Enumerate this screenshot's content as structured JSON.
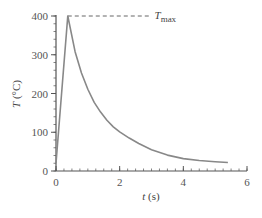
{
  "chart_data": {
    "type": "line",
    "title": "",
    "xlabel": "t (s)",
    "xlabel_var": "t",
    "xlabel_unit": " (s)",
    "ylabel": "T (°C)",
    "ylabel_var": "T",
    "ylabel_unit": " (°C)",
    "xlim": [
      0,
      6
    ],
    "ylim": [
      0,
      400
    ],
    "xticks": [
      0,
      2,
      4,
      6
    ],
    "yticks": [
      0,
      100,
      200,
      300,
      400
    ],
    "x_minor_step": 0.25,
    "y_minor_step": 20,
    "grid": false,
    "legend": null,
    "series": [
      {
        "name": "Temperature",
        "color": "#888888",
        "x": [
          0.0,
          0.37,
          0.6,
          0.8,
          1.0,
          1.2,
          1.4,
          1.6,
          1.8,
          2.0,
          2.3,
          2.6,
          3.0,
          3.5,
          4.0,
          4.5,
          5.0,
          5.4
        ],
        "y": [
          20,
          400,
          308,
          253,
          211,
          177,
          152,
          131,
          114,
          101,
          85,
          71,
          55,
          41,
          32,
          27,
          24,
          22
        ]
      }
    ],
    "annotations": [
      {
        "type": "hline",
        "y": 400,
        "x_start": 0.37,
        "x_end": 3.0,
        "style": "dashed",
        "label": "T",
        "label_sub": "max"
      }
    ]
  }
}
